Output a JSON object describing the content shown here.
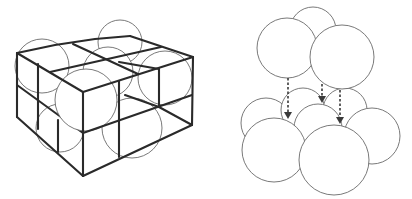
{
  "figure": {
    "left_panel": {
      "name": "cubic-close-packing-unit-cells",
      "description": "2x2x2 wireframe cube lattice with spheres at lattice points"
    },
    "right_panel": {
      "name": "sphere-layer-stacking",
      "description": "Top layer of three spheres descending onto bottom layer of seven spheres",
      "top_layer_count": 3,
      "bottom_layer_count": 7,
      "arrow_count": 3
    },
    "colors": {
      "background": "#ffffff",
      "lines": "#2a2a2a",
      "sphere_outline": "#6a6a6a"
    }
  }
}
